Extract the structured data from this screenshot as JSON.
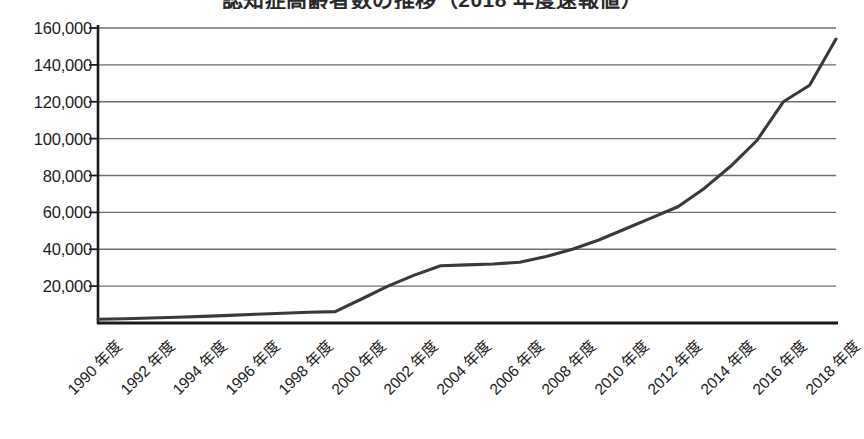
{
  "chart_data": {
    "type": "line",
    "title": "認知症高齢者数の推移（2018 年度速報値）",
    "title_clipped": true,
    "xlabel": "",
    "ylabel": "",
    "ylim": [
      0,
      160000
    ],
    "ytick_step": 20000,
    "ytick_labels": [
      "160,000",
      "140,000",
      "120,000",
      "100,000",
      "80,000",
      "60,000",
      "40,000",
      "20,000"
    ],
    "ytick_values": [
      160000,
      140000,
      120000,
      100000,
      80000,
      60000,
      40000,
      20000
    ],
    "grid": true,
    "grid_orientation": "horizontal",
    "legend": false,
    "legend_position": "none",
    "line_color": "#3a3a3a",
    "axis_color": "#1a1a1a",
    "grid_color": "#6e6e6e",
    "markers": false,
    "xtick_labels": [
      "1990 年度",
      "1992 年度",
      "1994 年度",
      "1996 年度",
      "1998 年度",
      "2000 年度",
      "2002 年度",
      "2004 年度",
      "2006 年度",
      "2008 年度",
      "2010 年度",
      "2012 年度",
      "2014 年度",
      "2016 年度",
      "2018 年度"
    ],
    "xtick_years": [
      1990,
      1992,
      1994,
      1996,
      1998,
      2000,
      2002,
      2004,
      2006,
      2008,
      2010,
      2012,
      2014,
      2016,
      2018
    ],
    "x": [
      1990,
      1991,
      1992,
      1993,
      1994,
      1995,
      1996,
      1997,
      1998,
      1999,
      2000,
      2001,
      2002,
      2003,
      2004,
      2005,
      2006,
      2007,
      2008,
      2009,
      2010,
      2011,
      2012,
      2013,
      2014,
      2015,
      2016,
      2017,
      2018
    ],
    "values": [
      2000,
      2300,
      2700,
      3100,
      3600,
      4100,
      4700,
      5300,
      5800,
      6200,
      13000,
      20000,
      26000,
      31000,
      31500,
      32000,
      33000,
      36000,
      40000,
      45000,
      51000,
      57000,
      63000,
      73000,
      85000,
      99000,
      120000,
      129000,
      154000
    ],
    "series_name": ""
  }
}
